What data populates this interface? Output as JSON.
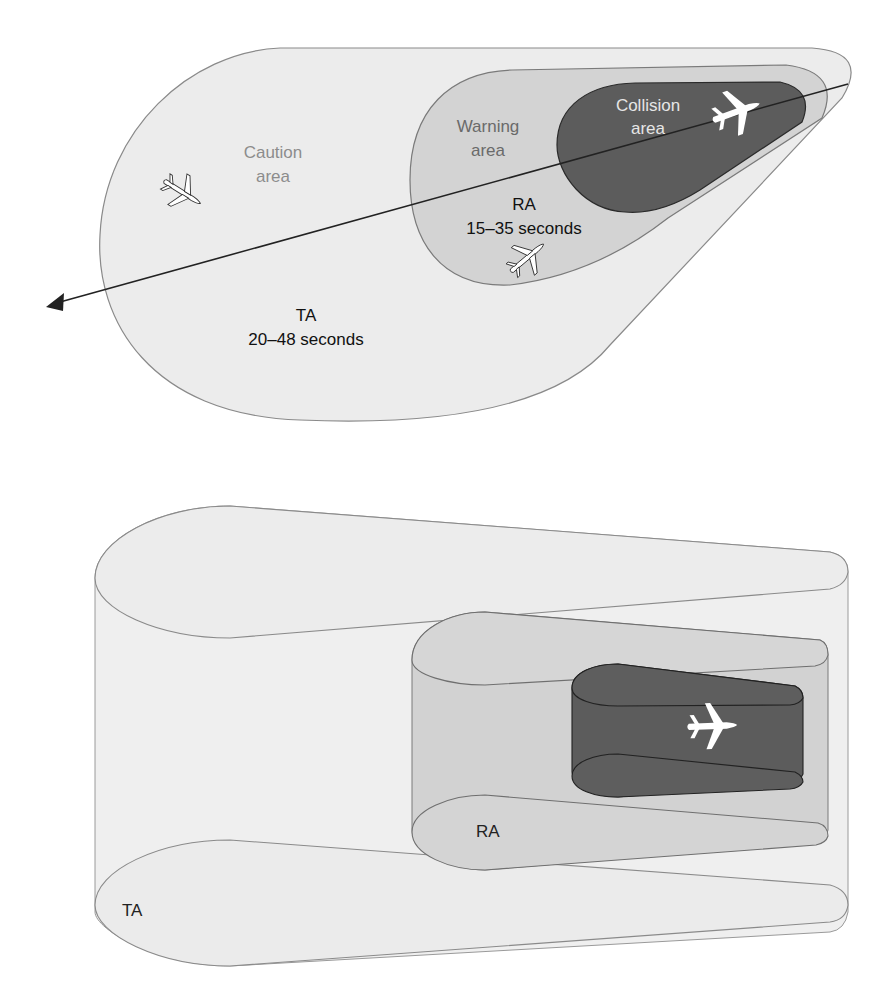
{
  "top_diagram": {
    "caution_label_line1": "Caution",
    "caution_label_line2": "area",
    "warning_label_line1": "Warning",
    "warning_label_line2": "area",
    "collision_label_line1": "Collision",
    "collision_label_line2": "area",
    "ra_label": "RA",
    "ra_time": "15–35 seconds",
    "ta_label": "TA",
    "ta_time": "20–48 seconds"
  },
  "bottom_diagram": {
    "ra_label": "RA",
    "ta_label": "TA"
  },
  "colors": {
    "caution_fill": "#ececec",
    "warning_fill": "#d2d2d2",
    "collision_fill": "#5a5a5a",
    "outline": "#8a8a8a",
    "flight_path": "#222222",
    "caution_text": "#8c8c8c",
    "warning_text": "#6a6a6a",
    "collision_text": "#e6e6e6"
  }
}
